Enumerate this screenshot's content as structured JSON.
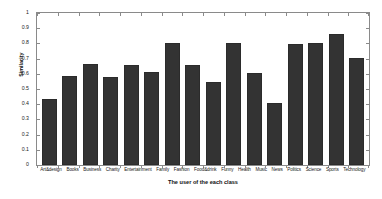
{
  "chart_data": {
    "type": "bar",
    "title": "",
    "xlabel": "The user of the each class",
    "ylabel": "Similarity",
    "ylim": [
      0,
      1
    ],
    "yticks": [
      0,
      0.1,
      0.2,
      0.3,
      0.4,
      0.5,
      0.6,
      0.7,
      0.8,
      0.9,
      1
    ],
    "ytick_labels": [
      "0",
      "0.1",
      "0.2",
      "0.3",
      "0.4",
      "0.5",
      "0.6",
      "0.7",
      "0.8",
      "0.9",
      "1"
    ],
    "grid": false,
    "legend": null,
    "bar_color": "#333333",
    "frame_color": "#8a8a8a",
    "categories": [
      "Art&design",
      "Books",
      "Business",
      "Charity",
      "Entertainment",
      "Family",
      "Fashion",
      "Food&drink",
      "Funny",
      "Health",
      "Music",
      "News",
      "Politics",
      "Science",
      "Sports",
      "Technology"
    ],
    "values": [
      0.435,
      0.585,
      0.665,
      0.58,
      0.655,
      0.615,
      0.805,
      0.655,
      0.548,
      0.8,
      0.605,
      0.41,
      0.795,
      0.805,
      0.862,
      0.705
    ]
  }
}
